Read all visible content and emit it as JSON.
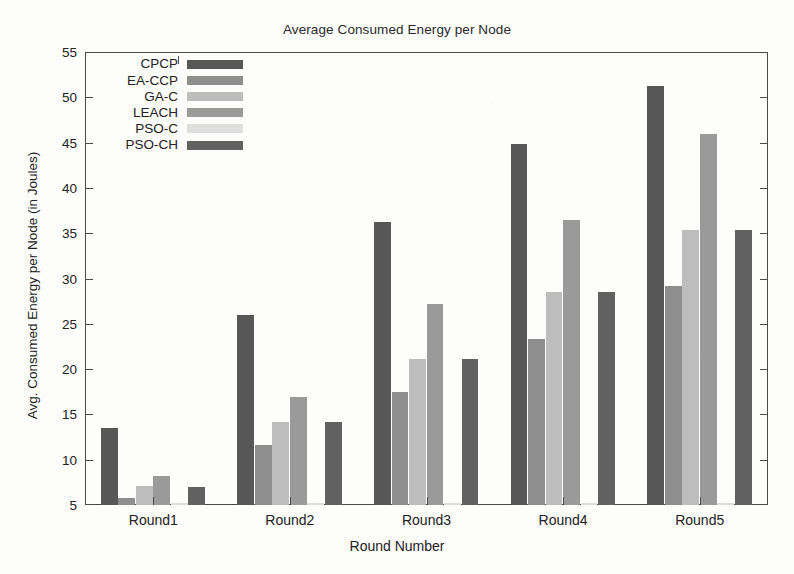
{
  "chart_data": {
    "type": "bar",
    "title": "Average Consumed Energy per Node",
    "xlabel": "Round Number",
    "ylabel": "Avg. Consumed Energy per Node (in Joules)",
    "categories": [
      "Round1",
      "Round2",
      "Round3",
      "Round4",
      "Round5"
    ],
    "ylim": [
      5,
      55
    ],
    "ytick_step": 5,
    "yticks": [
      5,
      10,
      15,
      20,
      25,
      30,
      35,
      40,
      45,
      50,
      55
    ],
    "ytick_labels": [
      "5",
      "10",
      "15",
      "20",
      "25",
      "30",
      "35",
      "40",
      "45",
      "50",
      "55"
    ],
    "grid": false,
    "legend_position": "top-left-inside",
    "series": [
      {
        "name": "CPCP",
        "color": "#575757",
        "values": [
          13.5,
          26.0,
          36.2,
          44.8,
          51.3
        ]
      },
      {
        "name": "EA-CCP",
        "color": "#8e8e8e",
        "values": [
          5.8,
          11.6,
          17.5,
          23.3,
          29.2
        ]
      },
      {
        "name": "GA-C",
        "color": "#bdbdbd",
        "values": [
          7.1,
          14.2,
          21.1,
          28.5,
          35.4
        ]
      },
      {
        "name": "LEACH",
        "color": "#9a9a9a",
        "values": [
          8.2,
          16.9,
          27.2,
          36.5,
          46.0
        ]
      },
      {
        "name": "PSO-C",
        "color": "#dedede",
        "values": [
          5.2,
          5.2,
          5.2,
          5.2,
          5.2
        ]
      },
      {
        "name": "PSO-CH",
        "color": "#616161",
        "values": [
          7.0,
          14.2,
          21.1,
          28.5,
          35.4
        ]
      }
    ]
  },
  "legend": {
    "items": [
      {
        "label": "CPCP",
        "color": "#575757"
      },
      {
        "label": "EA-CCP",
        "color": "#8e8e8e"
      },
      {
        "label": "GA-C",
        "color": "#bdbdbd"
      },
      {
        "label": "LEACH",
        "color": "#9a9a9a"
      },
      {
        "label": "PSO-C",
        "color": "#dedede"
      },
      {
        "label": "PSO-CH",
        "color": "#616161"
      }
    ]
  },
  "colors": {
    "axis": "#4a4a4a",
    "text": "#222222",
    "background": "#fdfdfb"
  }
}
